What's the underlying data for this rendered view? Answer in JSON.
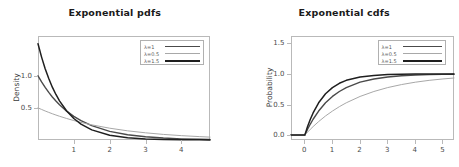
{
  "figure": {
    "background": "#ffffff",
    "width": 459,
    "height": 167
  },
  "panels": [
    {
      "id": "pdf-panel",
      "title": "Exponential pdfs",
      "ylabel": "Density",
      "xlabel": "",
      "yticks": [
        "0.5",
        "1.0"
      ],
      "xticks": [
        "1",
        "2",
        "3",
        "4"
      ],
      "legend": [
        {
          "label": "λ=1",
          "color": "#4a4a4a",
          "width": 1.4
        },
        {
          "label": "λ=0.5",
          "color": "#a8a8a8",
          "width": 1.0
        },
        {
          "label": "λ=1.5",
          "color": "#1f1f1f",
          "width": 1.5
        }
      ]
    },
    {
      "id": "cdf-panel",
      "title": "Exponential cdfs",
      "ylabel": "Probability",
      "xlabel": "",
      "yticks": [
        "0.0",
        "0.5",
        "1.0",
        "1.5"
      ],
      "xticks": [
        "0",
        "1",
        "2",
        "3",
        "4",
        "5"
      ],
      "legend": [
        {
          "label": "λ=1",
          "color": "#4a4a4a",
          "width": 1.4
        },
        {
          "label": "λ=0.5",
          "color": "#a8a8a8",
          "width": 1.0
        },
        {
          "label": "λ=1.5",
          "color": "#1f1f1f",
          "width": 1.5
        }
      ]
    }
  ],
  "chart_data": [
    {
      "type": "line",
      "title": "Exponential pdfs",
      "xlabel": "",
      "ylabel": "Density",
      "xlim": [
        0,
        4.8
      ],
      "ylim": [
        0,
        1.62
      ],
      "xticks": [
        1,
        2,
        3,
        4
      ],
      "yticks": [
        0.5,
        1.0
      ],
      "grid": false,
      "legend_position": "upper right",
      "x": [
        0,
        0.1,
        0.2,
        0.3,
        0.4,
        0.5,
        0.6,
        0.8,
        1.0,
        1.2,
        1.5,
        2.0,
        2.5,
        3.0,
        3.5,
        4.0,
        4.5,
        4.8
      ],
      "series": [
        {
          "name": "λ=1",
          "color": "#4a4a4a",
          "values": [
            1.0,
            0.905,
            0.819,
            0.741,
            0.67,
            0.607,
            0.549,
            0.449,
            0.368,
            0.301,
            0.223,
            0.135,
            0.082,
            0.05,
            0.03,
            0.018,
            0.011,
            0.008
          ]
        },
        {
          "name": "λ=0.5",
          "color": "#a8a8a8",
          "values": [
            0.5,
            0.476,
            0.452,
            0.43,
            0.409,
            0.389,
            0.37,
            0.335,
            0.303,
            0.274,
            0.236,
            0.184,
            0.143,
            0.112,
            0.087,
            0.068,
            0.053,
            0.045
          ]
        },
        {
          "name": "λ=1.5",
          "color": "#1f1f1f",
          "values": [
            1.5,
            1.291,
            1.111,
            0.957,
            0.823,
            0.709,
            0.61,
            0.452,
            0.335,
            0.248,
            0.158,
            0.075,
            0.035,
            0.017,
            0.008,
            0.004,
            0.002,
            0.001
          ]
        }
      ]
    },
    {
      "type": "line",
      "title": "Exponential cdfs",
      "xlabel": "",
      "ylabel": "Probability",
      "xlim": [
        -0.5,
        5.4
      ],
      "ylim": [
        -0.08,
        1.62
      ],
      "xticks": [
        0,
        1,
        2,
        3,
        4,
        5
      ],
      "yticks": [
        0.0,
        0.5,
        1.0,
        1.5
      ],
      "grid": false,
      "legend_position": "upper right",
      "x": [
        -0.5,
        0,
        0.1,
        0.2,
        0.3,
        0.5,
        0.75,
        1.0,
        1.25,
        1.5,
        2.0,
        2.5,
        3.0,
        3.5,
        4.0,
        4.5,
        5.0,
        5.4
      ],
      "series": [
        {
          "name": "λ=1",
          "color": "#4a4a4a",
          "values": [
            0,
            0,
            0.095,
            0.181,
            0.259,
            0.393,
            0.528,
            0.632,
            0.713,
            0.777,
            0.865,
            0.918,
            0.95,
            0.97,
            0.982,
            0.989,
            0.993,
            0.995
          ]
        },
        {
          "name": "λ=0.5",
          "color": "#a8a8a8",
          "values": [
            0,
            0,
            0.049,
            0.095,
            0.139,
            0.221,
            0.313,
            0.393,
            0.465,
            0.528,
            0.632,
            0.713,
            0.777,
            0.826,
            0.865,
            0.895,
            0.918,
            0.933
          ]
        },
        {
          "name": "λ=1.5",
          "color": "#1f1f1f",
          "values": [
            0,
            0,
            0.139,
            0.259,
            0.362,
            0.528,
            0.675,
            0.777,
            0.847,
            0.895,
            0.95,
            0.976,
            0.989,
            0.995,
            0.998,
            0.999,
            0.999,
            1.0
          ]
        }
      ]
    }
  ]
}
